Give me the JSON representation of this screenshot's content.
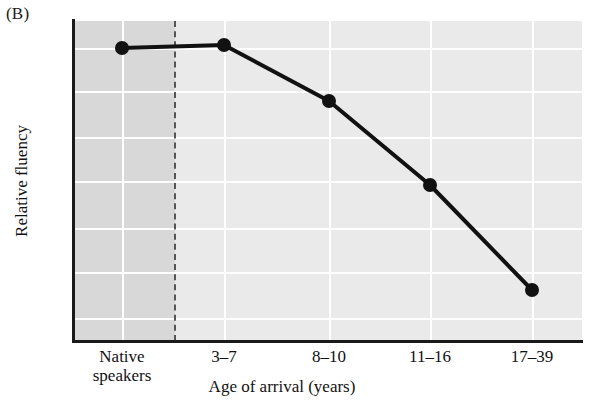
{
  "figure": {
    "panel_label": "(B)"
  },
  "chart_data": {
    "type": "line",
    "title": "",
    "xlabel": "Age of arrival (years)",
    "ylabel": "Relative fluency",
    "categories": [
      "Native\nspeakers",
      "3–7",
      "8–10",
      "11–16",
      "17–39"
    ],
    "tick_labels": [
      "Native\nspeakers",
      "3–7",
      "8–10",
      "11–16",
      "17–39"
    ],
    "values": [
      0.92,
      0.93,
      0.75,
      0.49,
      0.16
    ],
    "points_px": [
      {
        "x": 122,
        "y": 48
      },
      {
        "x": 224,
        "y": 45
      },
      {
        "x": 329,
        "y": 101
      },
      {
        "x": 430,
        "y": 185
      },
      {
        "x": 532,
        "y": 290
      }
    ],
    "ylim": [
      0,
      1
    ],
    "xlim": [
      0,
      5
    ],
    "grid": true,
    "y_ticks_shown": false,
    "legend": "none",
    "marker": "filled-circle",
    "line_color": "#111111",
    "plot_background": "#eaeaea",
    "shaded_region_color": "#d8d8d8",
    "shaded_region_label": "Native speakers",
    "divider_style": "dashed",
    "divider_color": "#555555",
    "gridline_color": "#ffffff",
    "annotations": []
  },
  "colors": {
    "axis": "#1a1a1a",
    "text": "#111111",
    "page_background": "#ffffff"
  }
}
